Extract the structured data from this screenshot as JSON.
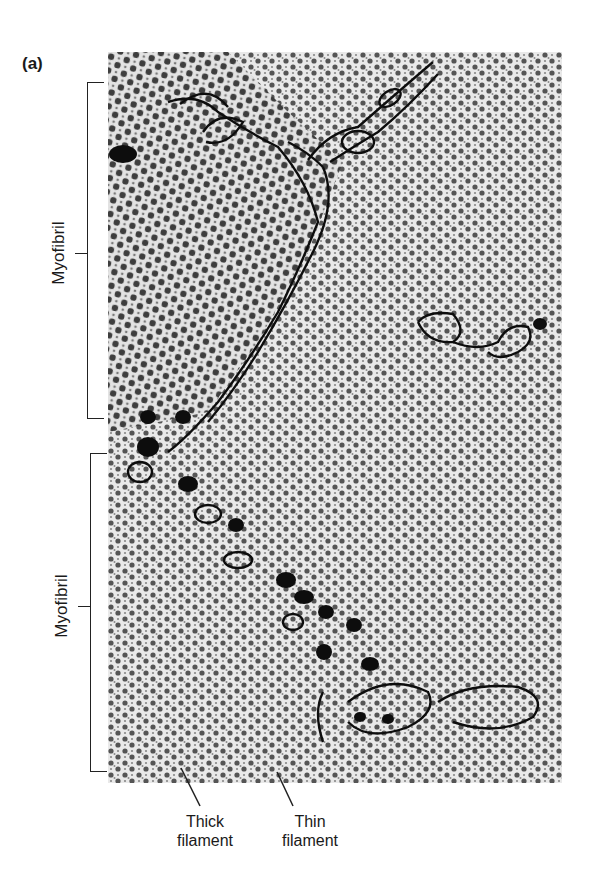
{
  "figure": {
    "panel_label": "(a)",
    "brackets": [
      {
        "label": "Myofibril"
      },
      {
        "label": "Myofibril"
      }
    ],
    "callouts": [
      {
        "line1": "Thick",
        "line2": "filament"
      },
      {
        "line1": "Thin",
        "line2": "filament"
      }
    ]
  }
}
